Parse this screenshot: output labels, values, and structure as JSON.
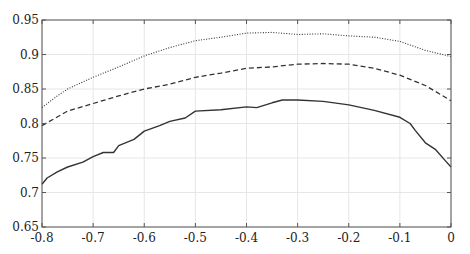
{
  "chart_data": {
    "type": "line",
    "title": "",
    "xlabel": "",
    "ylabel": "",
    "xlim": [
      -0.8,
      0
    ],
    "ylim": [
      0.65,
      0.95
    ],
    "grid": true,
    "legend": null,
    "x_ticks": [
      "-0.8",
      "-0.7",
      "-0.6",
      "-0.5",
      "-0.4",
      "-0.3",
      "-0.2",
      "-0.1",
      "0"
    ],
    "y_ticks": [
      "0.65",
      "0.7",
      "0.75",
      "0.8",
      "0.85",
      "0.9",
      "0.95"
    ],
    "series": [
      {
        "name": "dotted",
        "style": "dotted",
        "color": "#333333",
        "x": [
          -0.8,
          -0.77,
          -0.75,
          -0.7,
          -0.65,
          -0.6,
          -0.55,
          -0.5,
          -0.45,
          -0.4,
          -0.35,
          -0.3,
          -0.25,
          -0.2,
          -0.15,
          -0.1,
          -0.05,
          0.0
        ],
        "y": [
          0.823,
          0.84,
          0.85,
          0.867,
          0.882,
          0.898,
          0.91,
          0.92,
          0.925,
          0.931,
          0.932,
          0.929,
          0.93,
          0.927,
          0.925,
          0.919,
          0.906,
          0.897
        ]
      },
      {
        "name": "dashed",
        "style": "dashed",
        "color": "#333333",
        "x": [
          -0.8,
          -0.75,
          -0.7,
          -0.65,
          -0.6,
          -0.55,
          -0.5,
          -0.45,
          -0.4,
          -0.35,
          -0.3,
          -0.25,
          -0.2,
          -0.15,
          -0.1,
          -0.05,
          0.0
        ],
        "y": [
          0.797,
          0.818,
          0.829,
          0.84,
          0.85,
          0.857,
          0.867,
          0.873,
          0.88,
          0.882,
          0.886,
          0.887,
          0.886,
          0.88,
          0.87,
          0.855,
          0.833
        ]
      },
      {
        "name": "solid",
        "style": "solid",
        "color": "#333333",
        "x": [
          -0.8,
          -0.79,
          -0.77,
          -0.75,
          -0.72,
          -0.7,
          -0.68,
          -0.66,
          -0.65,
          -0.62,
          -0.6,
          -0.57,
          -0.55,
          -0.52,
          -0.5,
          -0.45,
          -0.4,
          -0.38,
          -0.35,
          -0.33,
          -0.3,
          -0.25,
          -0.2,
          -0.15,
          -0.1,
          -0.08,
          -0.07,
          -0.05,
          -0.03,
          -0.01,
          0.0
        ],
        "y": [
          0.712,
          0.721,
          0.73,
          0.737,
          0.744,
          0.752,
          0.758,
          0.758,
          0.768,
          0.777,
          0.789,
          0.797,
          0.803,
          0.808,
          0.818,
          0.82,
          0.824,
          0.823,
          0.83,
          0.834,
          0.834,
          0.832,
          0.827,
          0.819,
          0.809,
          0.8,
          0.79,
          0.772,
          0.762,
          0.745,
          0.737
        ]
      }
    ]
  },
  "layout": {
    "plot_left": 42,
    "plot_right": 451,
    "plot_top": 20,
    "plot_bottom": 227
  }
}
